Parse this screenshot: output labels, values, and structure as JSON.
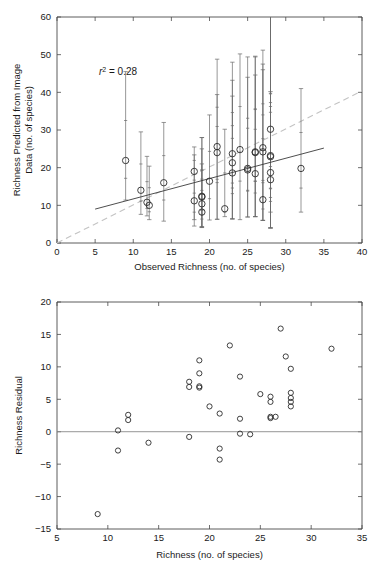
{
  "figure": {
    "name": "richness-prediction-figure",
    "panel_count": 2
  },
  "chart_data": [
    {
      "type": "scatter",
      "name": "predicted-vs-observed-richness",
      "title": "",
      "xlabel": "Observed Richness (no. of species)",
      "ylabel": "Richness Predicted from Image Data (no. of species)",
      "ylabel_line1": "Richness Predicted from Image",
      "ylabel_line2": "Data (no. of species)",
      "xlim": [
        0,
        40
      ],
      "ylim": [
        0,
        60
      ],
      "xticks": [
        0,
        5,
        10,
        15,
        20,
        25,
        30,
        35,
        40
      ],
      "yticks": [
        0,
        10,
        20,
        30,
        40,
        50,
        60
      ],
      "grid": false,
      "legend": "none",
      "annotations": [
        {
          "text": "r 2 = 0.28",
          "prefix": "r",
          "superscript": "2",
          "suffix": " = 0.28",
          "x": 5.5,
          "y": 44.5
        }
      ],
      "lines": [
        {
          "name": "regression-fit",
          "style": "solid",
          "color": "#3a3a3a",
          "x": [
            5.0,
            35.0
          ],
          "y": [
            9.0,
            25.2
          ]
        },
        {
          "name": "one-to-one-reference",
          "style": "dashed",
          "color": "#c3c3c3",
          "x": [
            0.0,
            40.0
          ],
          "y": [
            0.0,
            40.4
          ]
        }
      ],
      "x": [
        9,
        11,
        11.8,
        12.1,
        14,
        18,
        18,
        19,
        19,
        19,
        19,
        20,
        21,
        21,
        22,
        23,
        23,
        23,
        24,
        25,
        25,
        26,
        26,
        26,
        27,
        27,
        27,
        28,
        28,
        28,
        28,
        28,
        32
      ],
      "y": [
        21.9,
        14.0,
        10.8,
        10.0,
        16.0,
        19.0,
        11.2,
        12.4,
        12.2,
        10.4,
        8.2,
        16.4,
        25.6,
        24.0,
        9.1,
        23.7,
        21.3,
        18.6,
        24.8,
        19.8,
        19.4,
        24.2,
        24.0,
        18.4,
        25.3,
        11.5,
        24.2,
        30.2,
        23.2,
        22.9,
        18.7,
        16.8,
        19.8
      ],
      "yerr_low": [
        11.4,
        7.6,
        7.2,
        6.2,
        5.8,
        6.2,
        4.5,
        4.3,
        4.3,
        4.2,
        4.1,
        6.1,
        6.3,
        6.3,
        7.0,
        6.4,
        6.4,
        6.4,
        6.2,
        6.9,
        6.9,
        7.0,
        7.0,
        7.0,
        6.0,
        6.0,
        6.0,
        8.2,
        4.0,
        4.0,
        4.0,
        4.0,
        8.2
      ],
      "yerr_high": [
        45.5,
        29.5,
        23.0,
        20.4,
        32.0,
        25.5,
        23.4,
        28.0,
        28.0,
        25.0,
        21.0,
        34.0,
        48.8,
        39.4,
        30.2,
        48.0,
        43.2,
        39.0,
        50.2,
        49.4,
        44.0,
        49.6,
        49.4,
        44.6,
        51.2,
        47.5,
        46.0,
        40.2,
        60.0,
        60.0,
        60.0,
        60.0,
        41.0
      ]
    },
    {
      "type": "scatter",
      "name": "richness-residuals",
      "title": "",
      "xlabel": "Richness (no. of species)",
      "ylabel": "Richness Residual",
      "xlim": [
        5,
        35
      ],
      "ylim": [
        -15,
        20
      ],
      "xticks": [
        5,
        10,
        15,
        20,
        25,
        30,
        35
      ],
      "yticks": [
        -15,
        -10,
        -5,
        0,
        5,
        10,
        15,
        20
      ],
      "grid": false,
      "legend": "none",
      "reference_line": {
        "name": "zero-residual-line",
        "y": 0,
        "color": "#8a8a8a",
        "style": "solid"
      },
      "x": [
        9,
        11,
        11,
        12,
        12,
        14,
        18,
        18,
        18,
        19,
        19,
        19,
        19,
        20,
        21,
        21,
        21,
        22,
        23,
        23,
        23,
        24,
        25,
        26,
        26,
        26,
        26,
        26.5,
        27,
        27.5,
        28,
        28,
        28,
        28,
        28,
        32
      ],
      "y": [
        -12.7,
        0.2,
        -2.9,
        2.6,
        1.8,
        -1.7,
        7.7,
        6.9,
        -0.8,
        11.0,
        9.0,
        7.0,
        6.8,
        3.9,
        2.8,
        -2.6,
        -4.3,
        13.3,
        8.5,
        2.0,
        -0.3,
        -0.4,
        5.8,
        5.4,
        4.6,
        2.3,
        2.1,
        2.3,
        15.9,
        11.6,
        9.7,
        6.0,
        5.2,
        4.6,
        3.9,
        12.8
      ]
    }
  ]
}
